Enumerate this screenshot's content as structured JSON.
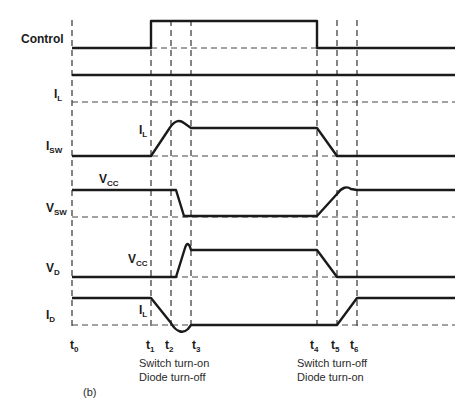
{
  "diagram": {
    "figure_label": "(b)",
    "signals": [
      {
        "id": "control",
        "name": "Control",
        "sub": ""
      },
      {
        "id": "il",
        "name": "I",
        "sub": "L"
      },
      {
        "id": "isw",
        "name": "I",
        "sub": "SW"
      },
      {
        "id": "vsw",
        "name": "V",
        "sub": "SW"
      },
      {
        "id": "vd",
        "name": "V",
        "sub": "D"
      },
      {
        "id": "id",
        "name": "I",
        "sub": "D"
      }
    ],
    "annotations": [
      {
        "id": "isw_il",
        "name": "I",
        "sub": "L"
      },
      {
        "id": "vsw_vcc",
        "name": "V",
        "sub": "CC"
      },
      {
        "id": "vd_vcc",
        "name": "V",
        "sub": "CC"
      },
      {
        "id": "id_il",
        "name": "I",
        "sub": "L"
      }
    ],
    "time_markers": [
      {
        "name": "t",
        "sub": "0"
      },
      {
        "name": "t",
        "sub": "1"
      },
      {
        "name": "t",
        "sub": "2"
      },
      {
        "name": "t",
        "sub": "3"
      },
      {
        "name": "t",
        "sub": "4"
      },
      {
        "name": "t",
        "sub": "5"
      },
      {
        "name": "t",
        "sub": "6"
      }
    ],
    "phases": [
      {
        "line1": "Switch turn-on",
        "line2": "Diode turn-off"
      },
      {
        "line1": "Switch turn-off",
        "line2": "Diode turn-on"
      }
    ],
    "colors": {
      "trace": "#1a1a1a",
      "guide": "#333333",
      "background": "#ffffff"
    }
  }
}
